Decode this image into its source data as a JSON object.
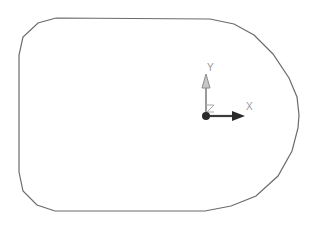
{
  "viewport": {
    "background": "#ffffff",
    "outline_color": "#6b6b6b"
  },
  "sketch": {
    "shape": "rounded-profile",
    "points": [
      [
        56,
        18
      ],
      [
        38,
        23
      ],
      [
        23,
        37
      ],
      [
        19,
        55
      ],
      [
        19,
        172
      ],
      [
        23,
        191
      ],
      [
        37,
        205
      ],
      [
        55,
        211
      ],
      [
        205,
        211
      ],
      [
        231,
        206
      ],
      [
        256,
        196
      ],
      [
        278,
        176
      ],
      [
        292,
        151
      ],
      [
        298,
        128
      ],
      [
        299,
        115
      ],
      [
        297,
        97
      ],
      [
        289,
        78
      ],
      [
        273,
        54
      ],
      [
        254,
        35
      ],
      [
        234,
        24
      ],
      [
        210,
        19
      ],
      [
        56,
        18
      ]
    ]
  },
  "triad": {
    "origin": [
      207,
      116
    ],
    "axes": {
      "x": {
        "label": "X",
        "color": "#3a3a3a"
      },
      "y": {
        "label": "Y",
        "color": "#8c8c8c"
      },
      "z": {
        "label": "Z",
        "color": "#9a9a9a"
      }
    }
  }
}
